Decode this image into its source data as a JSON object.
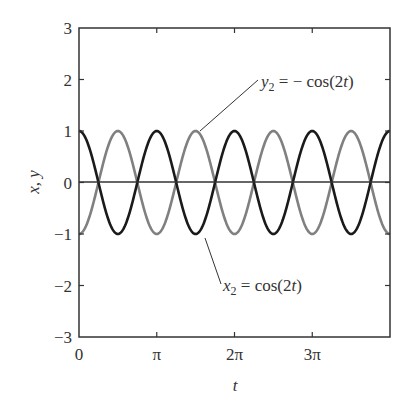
{
  "chart_data": {
    "type": "line",
    "title": "",
    "xlabel": "t",
    "ylabel": "x, y",
    "xlim": [
      0,
      12.566
    ],
    "ylim": [
      -3,
      3
    ],
    "grid": false,
    "legend": "none (inline annotations)",
    "x_ticks": [
      {
        "value": 0,
        "label": "0"
      },
      {
        "value": 3.1416,
        "label": "π"
      },
      {
        "value": 6.2832,
        "label": "2π"
      },
      {
        "value": 9.4248,
        "label": "3π"
      }
    ],
    "y_ticks": [
      {
        "value": 3,
        "label": "3"
      },
      {
        "value": 2,
        "label": "2"
      },
      {
        "value": 1,
        "label": "1"
      },
      {
        "value": 0,
        "label": "0"
      },
      {
        "value": -1,
        "label": "−1"
      },
      {
        "value": -2,
        "label": "−2"
      },
      {
        "value": -3,
        "label": "−3"
      }
    ],
    "series": [
      {
        "name": "x2 = cos(2t)",
        "function": "cos(2t)",
        "color": "#1a1a1a",
        "x": [
          0,
          0.785,
          1.571,
          2.356,
          3.142,
          3.927,
          4.712,
          5.498,
          6.283,
          7.069,
          7.854,
          8.639,
          9.425,
          10.21,
          10.996,
          11.781,
          12.566
        ],
        "values": [
          1,
          0,
          -1,
          0,
          1,
          0,
          -1,
          0,
          1,
          0,
          -1,
          0,
          1,
          0,
          -1,
          0,
          1
        ]
      },
      {
        "name": "y2 = −cos(2t)",
        "function": "-cos(2t)",
        "color": "#808080",
        "x": [
          0,
          0.785,
          1.571,
          2.356,
          3.142,
          3.927,
          4.712,
          5.498,
          6.283,
          7.069,
          7.854,
          8.639,
          9.425,
          10.21,
          10.996,
          11.781,
          12.566
        ],
        "values": [
          -1,
          0,
          1,
          0,
          -1,
          0,
          1,
          0,
          -1,
          0,
          1,
          0,
          -1,
          0,
          1,
          0,
          -1
        ]
      }
    ],
    "annotations": [
      {
        "text_var": "y",
        "text_sub": "2",
        "text_rest": " = − cos(2",
        "text_t": "t",
        "text_end": ")",
        "target_series": "y2 = −cos(2t)"
      },
      {
        "text_var": "x",
        "text_sub": "2",
        "text_rest": " = cos(2",
        "text_t": "t",
        "text_end": ")",
        "target_series": "x2 = cos(2t)"
      }
    ],
    "zero_line": true
  }
}
